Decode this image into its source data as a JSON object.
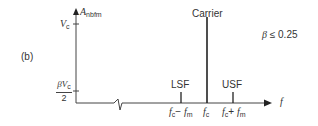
{
  "panel_label": "(b)",
  "y_axis": {
    "label_main": "A",
    "label_sub": "nbfm",
    "ticks": [
      {
        "main": "V",
        "sub": "c",
        "position": "top"
      },
      {
        "numerator": "βV",
        "numerator_sub": "c",
        "denominator": "2",
        "position": "bottom"
      }
    ]
  },
  "x_axis": {
    "label": "f",
    "ticks": [
      {
        "main": "f",
        "sub": "c",
        "op": "−",
        "main2": "f",
        "sub2": "m"
      },
      {
        "main": "f",
        "sub": "c"
      },
      {
        "main": "f",
        "sub": "c",
        "op": "+",
        "main2": "f",
        "sub2": "m"
      }
    ]
  },
  "components": [
    {
      "name": "LSF",
      "relative_height": 0.1
    },
    {
      "name": "Carrier",
      "relative_height": 1.0
    },
    {
      "name": "USF",
      "relative_height": 0.1
    }
  ],
  "condition": {
    "symbol": "β",
    "op": "≤",
    "value": "0.25"
  }
}
